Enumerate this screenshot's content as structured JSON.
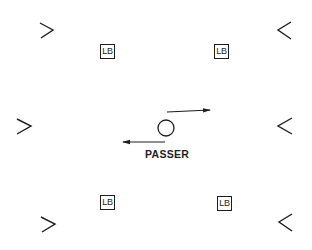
{
  "diagram": {
    "type": "football defensive alignment",
    "colors": {
      "ink": "#1e1e1e",
      "background": "#ffffff"
    },
    "linebackers": [
      {
        "label": "LB",
        "position": "top-left"
      },
      {
        "label": "LB",
        "position": "top-right"
      },
      {
        "label": "LB",
        "position": "bottom-left"
      },
      {
        "label": "LB",
        "position": "bottom-right"
      }
    ],
    "chevrons": [
      {
        "glyph": ">",
        "position": "top-left"
      },
      {
        "glyph": "<",
        "position": "top-right"
      },
      {
        "glyph": ">",
        "position": "middle-left"
      },
      {
        "glyph": "<",
        "position": "middle-right"
      },
      {
        "glyph": ">",
        "position": "bottom-left"
      },
      {
        "glyph": "<",
        "position": "bottom-right"
      }
    ],
    "passer": {
      "label": "PASSER",
      "symbol": "circle",
      "arrows": [
        {
          "direction": "right",
          "position": "above-right"
        },
        {
          "direction": "left",
          "position": "below-left"
        }
      ]
    }
  }
}
